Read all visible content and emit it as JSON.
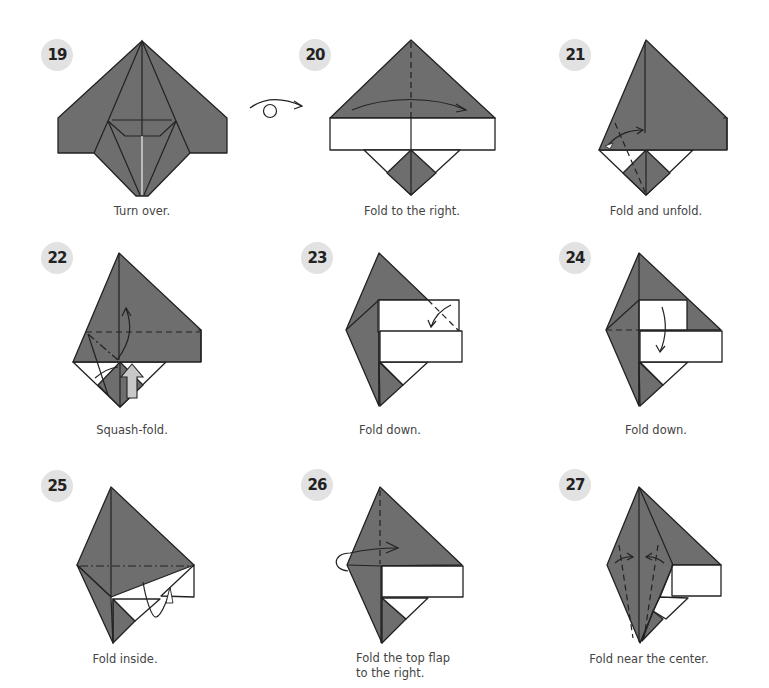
{
  "diagram": {
    "colors": {
      "paper_colored": "#6e6e6e",
      "paper_white": "#ffffff",
      "line": "#222222",
      "badge_bg": "#e2e2e2",
      "caption_text": "#444444"
    },
    "steps": [
      {
        "number": "19",
        "caption": "Turn over."
      },
      {
        "number": "20",
        "caption": "Fold to the right."
      },
      {
        "number": "21",
        "caption": "Fold and unfold."
      },
      {
        "number": "22",
        "caption": "Squash-fold."
      },
      {
        "number": "23",
        "caption": "Fold down."
      },
      {
        "number": "24",
        "caption": "Fold down."
      },
      {
        "number": "25",
        "caption": "Fold inside."
      },
      {
        "number": "26",
        "caption_line1": "Fold the top flap",
        "caption_line2": "to the right."
      },
      {
        "number": "27",
        "caption": "Fold near the center."
      }
    ],
    "symbols": {
      "turn_over": "turn-over-icon",
      "valley_fold": "dashed line",
      "mountain_fold": "dash-dot line",
      "push": "hollow push arrow"
    }
  }
}
